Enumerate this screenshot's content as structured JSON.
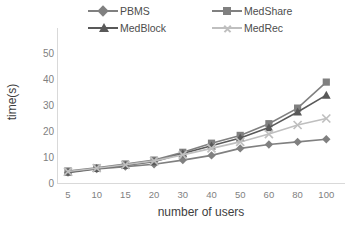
{
  "chart_data": {
    "type": "line",
    "title": "",
    "xlabel": "number of users",
    "ylabel": "time(s)",
    "categories": [
      "5",
      "10",
      "15",
      "20",
      "30",
      "40",
      "50",
      "60",
      "80",
      "100"
    ],
    "ylim": [
      0,
      50
    ],
    "yticks": [
      0,
      10,
      20,
      30,
      40,
      50
    ],
    "grid": false,
    "legend_position": "top",
    "series": [
      {
        "name": "PBMS",
        "marker": "diamond",
        "color": "#808080",
        "values": [
          4.2,
          5.6,
          6.5,
          7.4,
          9.0,
          10.8,
          13.5,
          15.0,
          16.0,
          17.0
        ]
      },
      {
        "name": "MedShare",
        "marker": "square",
        "color": "#808080",
        "values": [
          4.8,
          6.0,
          7.5,
          9.0,
          12.0,
          15.5,
          18.5,
          23.0,
          29.0,
          39.0
        ]
      },
      {
        "name": "MedBlock",
        "marker": "triangle",
        "color": "#595959",
        "values": [
          4.4,
          5.8,
          7.0,
          8.4,
          11.5,
          14.5,
          17.5,
          21.5,
          27.5,
          34.0
        ]
      },
      {
        "name": "MedRec",
        "marker": "cross",
        "color": "#bfbfbf",
        "values": [
          4.6,
          5.9,
          7.2,
          8.7,
          11.0,
          13.5,
          16.0,
          19.0,
          22.5,
          25.0
        ]
      }
    ]
  },
  "legend": {
    "items": [
      {
        "label": "PBMS"
      },
      {
        "label": "MedShare"
      },
      {
        "label": "MedBlock"
      },
      {
        "label": "MedRec"
      }
    ]
  },
  "axes": {
    "y_title": "time(s)",
    "x_title": "number of users",
    "y_ticks": [
      "50",
      "40",
      "30",
      "20",
      "10",
      "0"
    ],
    "x_ticks": [
      "5",
      "10",
      "15",
      "20",
      "30",
      "40",
      "50",
      "60",
      "80",
      "100"
    ]
  },
  "colors": {
    "pbms": "#808080",
    "medshare": "#808080",
    "medblock": "#595959",
    "medrec": "#bfbfbf",
    "axis": "#d9d9d9",
    "tick_text": "#7f7f7f"
  }
}
